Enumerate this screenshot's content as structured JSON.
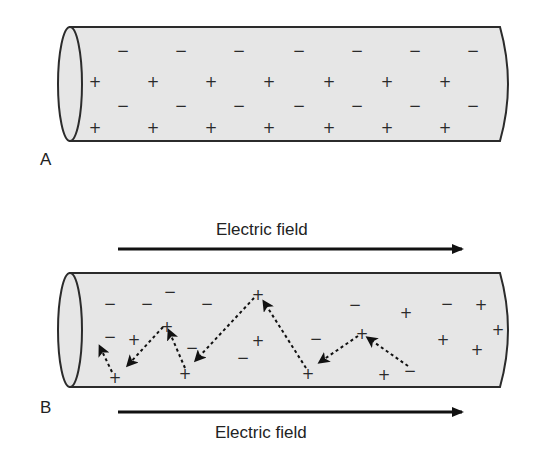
{
  "panels": [
    {
      "label": "A",
      "description": "Conductor in equilibrium: fixed positive ions and free electrons, no field",
      "tube": {
        "x1": 58,
        "x2": 514,
        "y1": 27,
        "y2": 141
      },
      "charges": [
        {
          "sign": "−",
          "x": 123,
          "y": 51
        },
        {
          "sign": "−",
          "x": 181,
          "y": 51
        },
        {
          "sign": "−",
          "x": 239,
          "y": 51
        },
        {
          "sign": "−",
          "x": 299,
          "y": 51
        },
        {
          "sign": "−",
          "x": 357,
          "y": 51
        },
        {
          "sign": "−",
          "x": 415,
          "y": 51
        },
        {
          "sign": "−",
          "x": 473,
          "y": 51
        },
        {
          "sign": "+",
          "x": 95,
          "y": 82
        },
        {
          "sign": "+",
          "x": 153,
          "y": 82
        },
        {
          "sign": "+",
          "x": 211,
          "y": 82
        },
        {
          "sign": "+",
          "x": 269,
          "y": 82
        },
        {
          "sign": "+",
          "x": 329,
          "y": 82
        },
        {
          "sign": "+",
          "x": 387,
          "y": 82
        },
        {
          "sign": "+",
          "x": 445,
          "y": 82
        },
        {
          "sign": "−",
          "x": 123,
          "y": 106
        },
        {
          "sign": "−",
          "x": 181,
          "y": 106
        },
        {
          "sign": "−",
          "x": 239,
          "y": 106
        },
        {
          "sign": "−",
          "x": 299,
          "y": 106
        },
        {
          "sign": "−",
          "x": 357,
          "y": 106
        },
        {
          "sign": "−",
          "x": 415,
          "y": 106
        },
        {
          "sign": "−",
          "x": 473,
          "y": 106
        },
        {
          "sign": "+",
          "x": 95,
          "y": 128
        },
        {
          "sign": "+",
          "x": 153,
          "y": 128
        },
        {
          "sign": "+",
          "x": 211,
          "y": 128
        },
        {
          "sign": "+",
          "x": 269,
          "y": 128
        },
        {
          "sign": "+",
          "x": 329,
          "y": 128
        },
        {
          "sign": "+",
          "x": 387,
          "y": 128
        },
        {
          "sign": "+",
          "x": 445,
          "y": 128
        }
      ]
    },
    {
      "label": "B",
      "description": "Electric field applied: electron drift path shown with dashed arrows",
      "tube": {
        "x1": 58,
        "x2": 514,
        "y1": 273,
        "y2": 387
      },
      "field_top": {
        "label": "Electric field",
        "direction": "right"
      },
      "field_bottom": {
        "label": "Electric field",
        "direction": "right"
      },
      "charges": [
        {
          "sign": "−",
          "x": 110,
          "y": 304
        },
        {
          "sign": "−",
          "x": 147,
          "y": 304
        },
        {
          "sign": "−",
          "x": 170,
          "y": 292
        },
        {
          "sign": "−",
          "x": 207,
          "y": 304
        },
        {
          "sign": "−",
          "x": 110,
          "y": 337
        },
        {
          "sign": "−",
          "x": 192,
          "y": 348
        },
        {
          "sign": "−",
          "x": 243,
          "y": 358
        },
        {
          "sign": "−",
          "x": 316,
          "y": 339
        },
        {
          "sign": "−",
          "x": 355,
          "y": 305
        },
        {
          "sign": "−",
          "x": 447,
          "y": 304
        },
        {
          "sign": "−",
          "x": 410,
          "y": 371
        },
        {
          "sign": "+",
          "x": 134,
          "y": 340
        },
        {
          "sign": "+",
          "x": 167,
          "y": 327
        },
        {
          "sign": "+",
          "x": 258,
          "y": 295
        },
        {
          "sign": "+",
          "x": 258,
          "y": 341
        },
        {
          "sign": "+",
          "x": 115,
          "y": 378
        },
        {
          "sign": "+",
          "x": 185,
          "y": 374
        },
        {
          "sign": "+",
          "x": 308,
          "y": 374
        },
        {
          "sign": "+",
          "x": 362,
          "y": 334
        },
        {
          "sign": "+",
          "x": 406,
          "y": 313
        },
        {
          "sign": "+",
          "x": 384,
          "y": 375
        },
        {
          "sign": "+",
          "x": 443,
          "y": 340
        },
        {
          "sign": "+",
          "x": 481,
          "y": 305
        },
        {
          "sign": "+",
          "x": 498,
          "y": 330
        },
        {
          "sign": "+",
          "x": 477,
          "y": 350
        }
      ],
      "electron_path": [
        {
          "from": [
            408,
            366
          ],
          "to": [
            368,
            338
          ]
        },
        {
          "from": [
            358,
            336
          ],
          "to": [
            320,
            362
          ]
        },
        {
          "from": [
            306,
            368
          ],
          "to": [
            264,
            302
          ]
        },
        {
          "from": [
            254,
            298
          ],
          "to": [
            196,
            360
          ]
        },
        {
          "from": [
            185,
            368
          ],
          "to": [
            169,
            331
          ]
        },
        {
          "from": [
            163,
            327
          ],
          "to": [
            128,
            365
          ]
        },
        {
          "from": [
            112,
            372
          ],
          "to": [
            100,
            347
          ]
        }
      ]
    }
  ],
  "colors": {
    "tube_fill": "#e6e6e6",
    "tube_stroke": "#2b2b2b",
    "text": "#222222",
    "arrow": "#111111"
  }
}
